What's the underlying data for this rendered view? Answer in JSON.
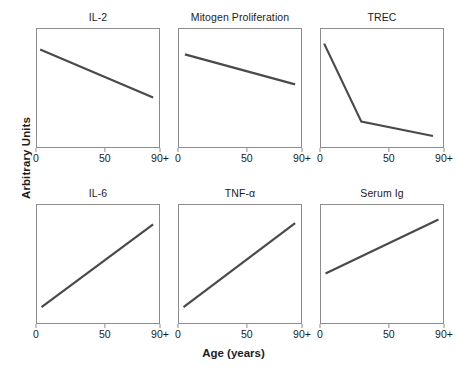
{
  "figure": {
    "ylabel": "Arbitrary Units",
    "xlabel": "Age (years)",
    "line_color": "#4a4a4a",
    "border_color": "#8c8c8c",
    "caption": ""
  },
  "chart_data": [
    {
      "type": "line",
      "title": "IL-2",
      "xlabel": "Age (years)",
      "ylabel": "Arbitrary Units",
      "xlim": [
        0,
        90
      ],
      "ylim": [
        0,
        1
      ],
      "xticks": [
        0,
        50,
        90
      ],
      "xticklabels": [
        "0",
        "50",
        "90+"
      ],
      "grid": false,
      "legend": "none",
      "x": [
        3,
        85
      ],
      "y": [
        0.82,
        0.42
      ]
    },
    {
      "type": "line",
      "title": "Mitogen Proliferation",
      "xlabel": "Age (years)",
      "ylabel": "Arbitrary Units",
      "xlim": [
        0,
        90
      ],
      "ylim": [
        0,
        1
      ],
      "xticks": [
        0,
        50,
        90
      ],
      "xticklabels": [
        "0",
        "50",
        "90+"
      ],
      "grid": false,
      "legend": "none",
      "x": [
        5,
        85
      ],
      "y": [
        0.78,
        0.53
      ]
    },
    {
      "type": "line",
      "title": "TREC",
      "xlabel": "Age (years)",
      "ylabel": "Arbitrary Units",
      "xlim": [
        0,
        90
      ],
      "ylim": [
        0,
        1
      ],
      "xticks": [
        0,
        50,
        90
      ],
      "xticklabels": [
        "0",
        "50",
        "90+"
      ],
      "grid": false,
      "legend": "none",
      "x": [
        3,
        30,
        82
      ],
      "y": [
        0.87,
        0.22,
        0.1
      ]
    },
    {
      "type": "line",
      "title": "IL-6",
      "xlabel": "Age (years)",
      "ylabel": "Arbitrary Units",
      "xlim": [
        0,
        90
      ],
      "ylim": [
        0,
        1
      ],
      "xticks": [
        0,
        50,
        90
      ],
      "xticklabels": [
        "0",
        "50",
        "90+"
      ],
      "grid": false,
      "legend": "none",
      "x": [
        4,
        85
      ],
      "y": [
        0.14,
        0.83
      ]
    },
    {
      "type": "line",
      "title": "TNF-α",
      "xlabel": "Age (years)",
      "ylabel": "Arbitrary Units",
      "xlim": [
        0,
        90
      ],
      "ylim": [
        0,
        1
      ],
      "xticks": [
        0,
        50,
        90
      ],
      "xticklabels": [
        "0",
        "50",
        "90+"
      ],
      "grid": false,
      "legend": "none",
      "x": [
        4,
        85
      ],
      "y": [
        0.14,
        0.84
      ]
    },
    {
      "type": "line",
      "title": "Serum Ig",
      "xlabel": "Age (years)",
      "ylabel": "Arbitrary Units",
      "xlim": [
        0,
        90
      ],
      "ylim": [
        0,
        1
      ],
      "xticks": [
        0,
        50,
        90
      ],
      "xticklabels": [
        "0",
        "50",
        "90+"
      ],
      "grid": false,
      "legend": "none",
      "x": [
        4,
        86
      ],
      "y": [
        0.42,
        0.87
      ]
    }
  ],
  "panels_geometry": [
    {
      "left": 36,
      "top": 28,
      "width": 124,
      "height": 120
    },
    {
      "left": 178,
      "top": 28,
      "width": 124,
      "height": 120
    },
    {
      "left": 320,
      "top": 28,
      "width": 124,
      "height": 120
    },
    {
      "left": 36,
      "top": 204,
      "width": 124,
      "height": 120
    },
    {
      "left": 178,
      "top": 204,
      "width": 124,
      "height": 120
    },
    {
      "left": 320,
      "top": 204,
      "width": 124,
      "height": 120
    }
  ]
}
